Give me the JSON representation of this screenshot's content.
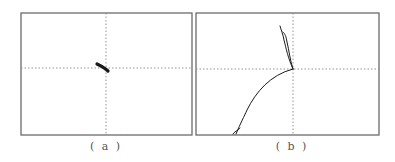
{
  "figure": {
    "panels": [
      {
        "id": "a",
        "caption": "( a )",
        "frame": {
          "x": 21,
          "y": 13,
          "w": 171,
          "h": 122
        },
        "crosshair": {
          "x": 106,
          "y": 68
        },
        "trace": {
          "description": "short thick stroke near center",
          "path": "M97,64 C101,66 105,68 108,71",
          "stroke_width": 3.2
        }
      },
      {
        "id": "b",
        "caption": "( b )",
        "frame": {
          "x": 196,
          "y": 13,
          "w": 183,
          "h": 122
        },
        "crosshair": {
          "x": 293,
          "y": 69
        },
        "trace": {
          "description": "trajectory from bottom-left up to center, then narrow loop upward",
          "path": "M233,134 C236,130 238,131 240,128 M236,134 C241,122 244,117 247,110 C256,92 270,75 293,69 M293,69 C288,58 286,48 284,40 C283,34 281,30 280,26 M293,69 C290,60 289,50 287,42 C286,36 285,34 283,32",
          "stroke_width": 1
        }
      }
    ],
    "colors": {
      "frame": "#6b6b6b",
      "guide": "#8a8a8a",
      "trace": "#1a1a1a",
      "background": "#ffffff"
    }
  }
}
